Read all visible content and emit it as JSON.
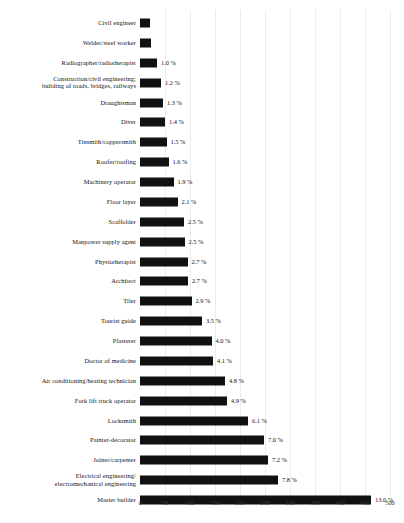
{
  "chart_data": {
    "type": "bar",
    "orientation": "horizontal",
    "title": "",
    "subtitle": "",
    "xlabel": "",
    "ylabel": "",
    "xlim": [
      0,
      500
    ],
    "ticks": [
      "0",
      "50",
      "100",
      "150",
      "200",
      "250",
      "300",
      "350",
      "400",
      "450",
      "500"
    ],
    "tick_values": [
      0,
      50,
      100,
      150,
      200,
      250,
      300,
      350,
      400,
      450,
      500
    ],
    "grid": true,
    "legend": "none",
    "bar_color": "#111111",
    "categories": [
      "Civil engineer",
      "Welder/steel worker",
      "Radiographer/radiotherapist",
      "Construction/civil engineering;\nbuilding of roads, bridges, railways",
      "Draughtsman",
      "Diver",
      "Tinsmith/coppersmith",
      "Roofer/roofing",
      "Machinery operator",
      "Floor layer",
      "Scaffolder",
      "Manpower supply agent",
      "Physiotherapist",
      "Architect",
      "Tiler",
      "Tourist guide",
      "Plasterer",
      "Doctor of medicine",
      "Air conditioning/heating technician",
      "Fork lift truck operator",
      "Locksmith",
      "Painter-decorator",
      "Joiner/carpenter",
      "Electrical engineering/\nelectromechanical engineering",
      "Master builder"
    ],
    "values": [
      20,
      22,
      34,
      42,
      46,
      50,
      53,
      57,
      67,
      75,
      88,
      89,
      95,
      96,
      103,
      124,
      143,
      146,
      170,
      174,
      216,
      248,
      256,
      276,
      462
    ],
    "value_labels": [
      "",
      "",
      "1.0 %",
      "1.2 %",
      "1.3 %",
      "1.4 %",
      "1.5 %",
      "1.6 %",
      "1.9 %",
      "2.1 %",
      "2.5 %",
      "2.5 %",
      "2.7 %",
      "2.7 %",
      "2.9 %",
      "3.5 %",
      "4.0 %",
      "4.1 %",
      "4.8 %",
      "4.9 %",
      "6.1 %",
      "7.0 %",
      "7.2 %",
      "7.8 %",
      "13.0 %"
    ]
  }
}
